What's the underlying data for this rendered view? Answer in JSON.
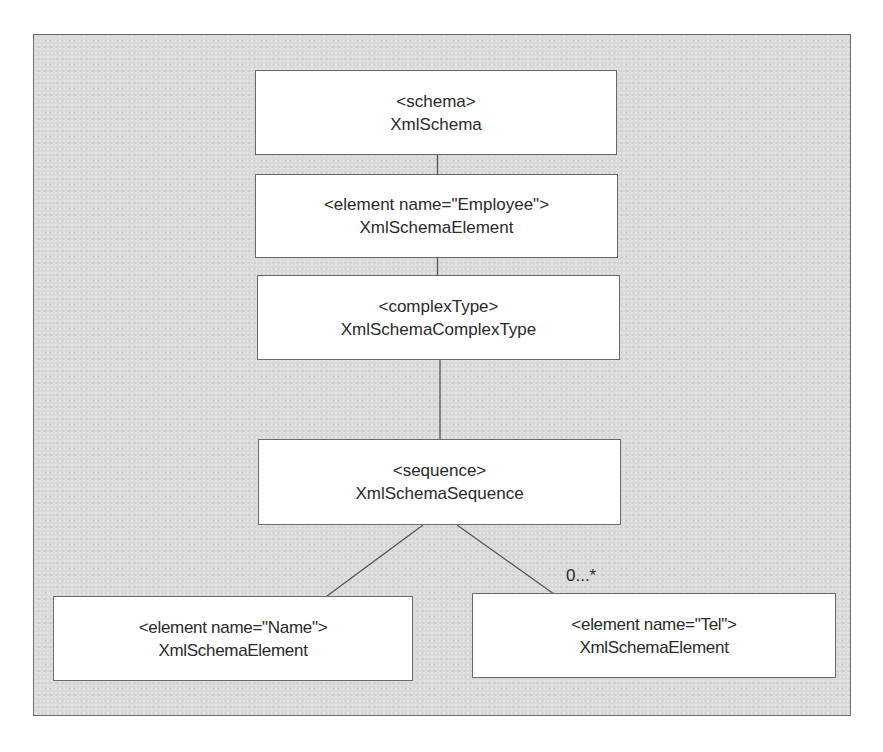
{
  "diagram": {
    "type": "tree",
    "colors": {
      "panel_background": "#d9d9d9",
      "panel_border": "#6e6e6e",
      "node_background": "#ffffff",
      "node_border": "#6a6a6a",
      "text": "#2a2a2a",
      "connector": "#555555"
    },
    "nodes": [
      {
        "id": "schema",
        "tag": "<schema>",
        "class_name": "XmlSchema"
      },
      {
        "id": "employee",
        "tag": "<element name=\"Employee\">",
        "class_name": "XmlSchemaElement"
      },
      {
        "id": "complexType",
        "tag": "<complexType>",
        "class_name": "XmlSchemaComplexType"
      },
      {
        "id": "sequence",
        "tag": "<sequence>",
        "class_name": "XmlSchemaSequence"
      },
      {
        "id": "name",
        "tag": "<element name=\"Name\">",
        "class_name": "XmlSchemaElement"
      },
      {
        "id": "tel",
        "tag": "<element name=\"Tel\">",
        "class_name": "XmlSchemaElement"
      }
    ],
    "edges": [
      {
        "from": "schema",
        "to": "employee",
        "label": ""
      },
      {
        "from": "employee",
        "to": "complexType",
        "label": ""
      },
      {
        "from": "complexType",
        "to": "sequence",
        "label": ""
      },
      {
        "from": "sequence",
        "to": "name",
        "label": ""
      },
      {
        "from": "sequence",
        "to": "tel",
        "label": "0...*"
      }
    ]
  }
}
